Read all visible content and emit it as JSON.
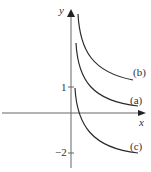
{
  "figure": {
    "axes": {
      "x_label": "x",
      "y_label": "y",
      "y_ticks": [
        {
          "value": 1,
          "label": "1"
        },
        {
          "value": -2,
          "label": "−2"
        }
      ]
    },
    "curves": [
      {
        "id": "a",
        "label": "(a)",
        "description": "decreasing curve, asymptote at y-axis, approaching ~0.6 from above"
      },
      {
        "id": "b",
        "label": "(b)",
        "description": "decreasing curve shifted up, approaching ~1.6"
      },
      {
        "id": "c",
        "label": "(c)",
        "description": "decreasing curve starting at y=1, approaching -2"
      }
    ],
    "colors": {
      "line": "#2b2b2b",
      "axis": "#555555",
      "text": "#333333"
    }
  }
}
